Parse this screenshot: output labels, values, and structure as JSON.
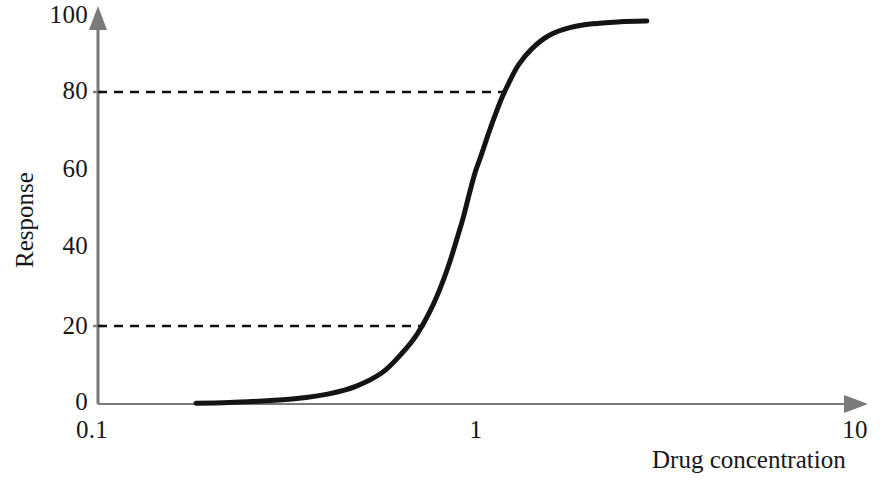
{
  "chart_data": {
    "type": "line",
    "title": "",
    "subtitle": "",
    "xlabel": "Drug concentration",
    "ylabel": "Response",
    "xscale": "log",
    "yscale": "linear",
    "xlim": [
      0.1,
      10
    ],
    "ylim": [
      0,
      100
    ],
    "xticks": [
      "0.1",
      "1",
      "10"
    ],
    "xtick_values": [
      0.1,
      1,
      10
    ],
    "yticks": [
      "0",
      "20",
      "40",
      "60",
      "80",
      "100"
    ],
    "ytick_values": [
      0,
      20,
      40,
      60,
      80,
      100
    ],
    "grid": false,
    "legend": null,
    "series": [
      {
        "name": "Dose-response curve",
        "color": "#141414",
        "linewidth": 5,
        "style": "solid",
        "x": [
          0.18,
          0.22,
          0.27,
          0.33,
          0.4,
          0.47,
          0.55,
          0.62,
          0.68,
          0.74,
          0.79,
          0.83,
          0.87,
          0.9,
          0.93,
          0.96,
          1.0,
          1.04,
          1.08,
          1.13,
          1.18,
          1.25,
          1.35,
          1.5,
          1.7,
          1.95,
          2.3,
          2.7
        ],
        "y": [
          0.2,
          0.4,
          0.8,
          1.4,
          2.6,
          4.5,
          8.0,
          13.0,
          18.0,
          24.5,
          31.0,
          37.0,
          43.5,
          48.5,
          54.0,
          59.0,
          64.0,
          69.0,
          73.5,
          78.5,
          82.5,
          87.0,
          91.0,
          94.5,
          96.5,
          97.5,
          98.0,
          98.2
        ]
      }
    ],
    "annotations": [
      {
        "name": "upper-reference-line",
        "type": "dashed-horizontal",
        "y": 80,
        "x_start": 0.1,
        "x_end": 1.2,
        "color": "#111111"
      },
      {
        "name": "lower-reference-line",
        "type": "dashed-horizontal",
        "y": 20,
        "x_start": 0.1,
        "x_end": 0.71,
        "color": "#111111"
      }
    ],
    "axis_style": {
      "color": "#7a7a7a",
      "arrow_heads": true,
      "spines": [
        "left",
        "bottom"
      ]
    }
  },
  "axes": {
    "y_title": "Response",
    "x_title": "Drug concentration",
    "y_tick_labels": [
      "100",
      "80",
      "60",
      "40",
      "20",
      "0"
    ],
    "x_tick_labels": [
      "0.1",
      "1",
      "10"
    ]
  },
  "colors": {
    "axis": "#7a7a7a",
    "curve": "#141414",
    "dashed": "#111111",
    "text": "#171717",
    "background": "#ffffff"
  }
}
